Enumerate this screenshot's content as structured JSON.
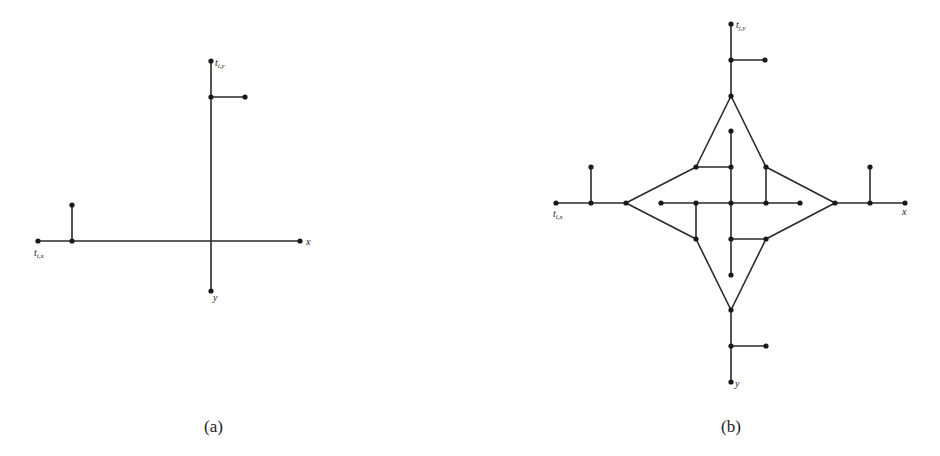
{
  "figures": [
    {
      "id": "a",
      "caption": "(a)",
      "labels": {
        "tx": "t",
        "tx_sub": "i,x",
        "ty": "t",
        "ty_sub": "i,y",
        "x": "x",
        "y": "y"
      },
      "edges": [
        [
          211,
          61,
          211,
          291
        ],
        [
          38,
          241,
          300,
          241
        ],
        [
          211,
          97,
          245,
          97
        ],
        [
          72,
          241,
          72,
          205
        ]
      ],
      "nodes": [
        [
          211,
          61
        ],
        [
          211,
          97
        ],
        [
          245,
          97
        ],
        [
          38,
          241
        ],
        [
          72,
          241
        ],
        [
          72,
          205
        ],
        [
          300,
          241
        ],
        [
          211,
          291
        ]
      ]
    },
    {
      "id": "b",
      "caption": "(b)",
      "labels": {
        "tx": "t",
        "tx_sub": "i,x",
        "ty": "t",
        "ty_sub": "j,y",
        "x": "x",
        "y": "y"
      },
      "edges": [
        [
          731,
          24,
          731,
          96
        ],
        [
          731,
          60,
          765,
          60
        ],
        [
          731,
          310,
          731,
          382
        ],
        [
          731,
          346,
          766,
          346
        ],
        [
          556,
          203,
          626,
          203
        ],
        [
          591,
          203,
          591,
          167
        ],
        [
          835,
          203,
          905,
          203
        ],
        [
          870,
          203,
          870,
          167
        ],
        [
          731,
          96,
          696,
          167
        ],
        [
          696,
          167,
          626,
          203
        ],
        [
          626,
          203,
          696,
          239
        ],
        [
          696,
          239,
          731,
          310
        ],
        [
          731,
          310,
          766,
          239
        ],
        [
          766,
          239,
          835,
          203
        ],
        [
          835,
          203,
          766,
          167
        ],
        [
          766,
          167,
          731,
          96
        ],
        [
          661,
          203,
          800,
          203
        ],
        [
          731,
          131,
          731,
          275
        ],
        [
          696,
          167,
          731,
          167
        ],
        [
          766,
          167,
          766,
          203
        ],
        [
          696,
          203,
          696,
          239
        ],
        [
          731,
          239,
          766,
          239
        ]
      ],
      "nodes": [
        [
          731,
          24
        ],
        [
          731,
          60
        ],
        [
          765,
          60
        ],
        [
          731,
          96
        ],
        [
          731,
          131
        ],
        [
          696,
          167
        ],
        [
          731,
          167
        ],
        [
          766,
          167
        ],
        [
          591,
          167
        ],
        [
          870,
          167
        ],
        [
          556,
          203
        ],
        [
          591,
          203
        ],
        [
          626,
          203
        ],
        [
          661,
          203
        ],
        [
          696,
          203
        ],
        [
          731,
          203
        ],
        [
          766,
          203
        ],
        [
          800,
          203
        ],
        [
          835,
          203
        ],
        [
          870,
          203
        ],
        [
          905,
          203
        ],
        [
          696,
          239
        ],
        [
          731,
          239
        ],
        [
          766,
          239
        ],
        [
          731,
          275
        ],
        [
          731,
          310
        ],
        [
          731,
          346
        ],
        [
          766,
          346
        ],
        [
          731,
          382
        ]
      ]
    }
  ]
}
